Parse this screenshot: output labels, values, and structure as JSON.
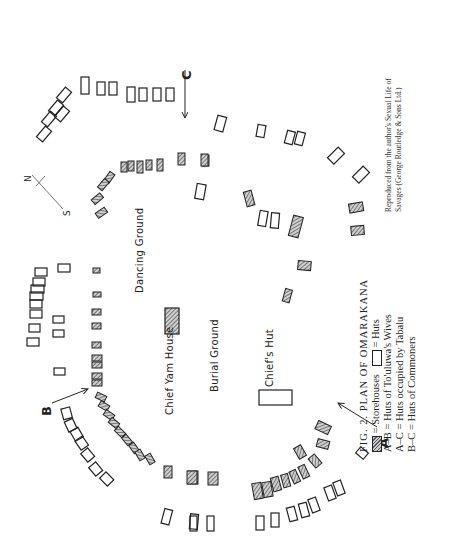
{
  "figure": {
    "number_label": "FIG. 2.",
    "title": "PLAN OF OMARAKANA",
    "legend": [
      {
        "symbol": "hatched-rect",
        "label": "Storehouses"
      },
      {
        "symbol": "open-rect",
        "label": "Huts"
      },
      {
        "key": "A–B",
        "label": "Huts of To'uluwa's Wives"
      },
      {
        "key": "A–C",
        "label": "Huts occupied by Tabalu"
      },
      {
        "key": "B–C",
        "label": "Huts of Commoners"
      }
    ],
    "legend_eq": "=",
    "credit_line1": "Reproduced from the author's Sexual Life of",
    "credit_line2": "Savages (George Routledge & Sons Ltd.)"
  },
  "map": {
    "areas": {
      "dancing_ground": "Dancing Ground",
      "chief_yam_house": "Chief Yam House",
      "burial_ground": "Burial Ground",
      "chiefs_hut": "Chief's Hut"
    },
    "markers": {
      "a": "A",
      "b": "B",
      "c": "C"
    },
    "compass": {
      "north": "N",
      "south": "S"
    },
    "colors": {
      "ink": "#222222",
      "hatch_dark": "#555555",
      "hatch_light": "#cccccc",
      "paper": "#ffffff"
    }
  }
}
